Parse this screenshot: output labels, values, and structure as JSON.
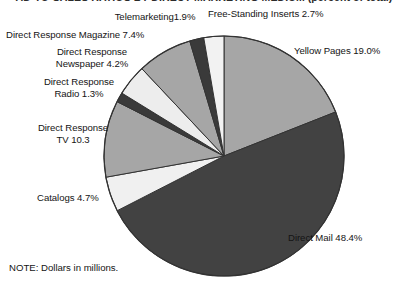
{
  "title_clipped": "AD-TO-SALES RATIOS BY DIRECT MARKETING MEDIUM (percent of total)",
  "note": "NOTE: Dollars in millions.",
  "colors": {
    "background": "#ffffff",
    "text": "#141414",
    "outline": "#333333",
    "slice_mid_gray": "#a6a6a6",
    "slice_dark_gray": "#424242",
    "slice_light": "#ededed",
    "slice_near_white": "#f2f2f2",
    "slice_very_dark": "#3a3a3a"
  },
  "chart_data": {
    "type": "pie",
    "title": "",
    "xlabel": "",
    "ylabel": "",
    "legend_position": "callout-labels",
    "grid": false,
    "start_angle_deg": 0,
    "direction": "clockwise",
    "center": {
      "x": 224,
      "y": 156
    },
    "radius": 120,
    "categories": [
      "Yellow Pages",
      "Direct Mail",
      "Catalogs",
      "Direct Response TV",
      "Direct Response Radio",
      "Direct Response Newspaper",
      "Direct Response Magazine",
      "Telemarketing",
      "Free-Standing Inserts"
    ],
    "values": [
      19.0,
      48.4,
      4.7,
      10.3,
      1.3,
      4.2,
      7.4,
      1.9,
      2.7
    ],
    "total": 99.9,
    "slices": [
      {
        "name": "Yellow Pages",
        "value": 19.0,
        "label": "Yellow Pages 19.0%",
        "color": "#a6a6a6"
      },
      {
        "name": "Direct Mail",
        "value": 48.4,
        "label": "Direct Mail 48.4%",
        "color": "#424242"
      },
      {
        "name": "Catalogs",
        "value": 4.7,
        "label": "Catalogs 4.7%",
        "color": "#f0f0f0"
      },
      {
        "name": "Direct Response TV",
        "value": 10.3,
        "label": "Direct Response\nTV 10.3",
        "color": "#a6a6a6"
      },
      {
        "name": "Direct Response Radio",
        "value": 1.3,
        "label": "Direct Response\nRadio 1.3%",
        "color": "#3a3a3a"
      },
      {
        "name": "Direct Response Newspaper",
        "value": 4.2,
        "label": "Direct Response\nNewspaper 4.2%",
        "color": "#ededed"
      },
      {
        "name": "Direct Response Magazine",
        "value": 7.4,
        "label": "Direct Response Magazine 7.4%",
        "color": "#a6a6a6"
      },
      {
        "name": "Telemarketing",
        "value": 1.9,
        "label": "Telemarketing1.9%",
        "color": "#3a3a3a"
      },
      {
        "name": "Free-Standing Inserts",
        "value": 2.7,
        "label": "Free-Standing Inserts 2.7%",
        "color": "#f2f2f2"
      }
    ]
  },
  "labels": {
    "telemarketing": "Telemarketing1.9%",
    "free_standing_inserts": "Free-Standing Inserts 2.7%",
    "dr_magazine": "Direct Response Magazine 7.4%",
    "dr_newspaper_l1": "Direct Response",
    "dr_newspaper_l2": "Newspaper 4.2%",
    "dr_radio_l1": "Direct Response",
    "dr_radio_l2": "Radio 1.3%",
    "dr_tv_l1": "Direct Response",
    "dr_tv_l2": "TV 10.3",
    "catalogs": "Catalogs 4.7%",
    "yellow_pages": "Yellow Pages 19.0%",
    "direct_mail": "Direct Mail 48.4%"
  }
}
